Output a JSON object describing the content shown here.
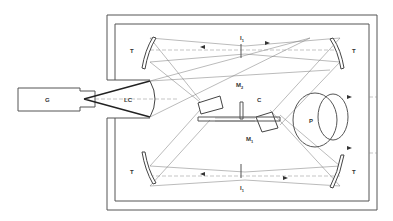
{
  "diagram": {
    "labels": {
      "G": "G",
      "LC": "LC",
      "T_top_left": "T",
      "T_top_right": "T",
      "T_bottom_left": "T",
      "T_bottom_right": "T",
      "I1_top": "I",
      "I1_top_sub": "1",
      "I1_bottom": "I",
      "I1_bottom_sub": "1",
      "M2": "M",
      "M2_sub": "2",
      "M1": "M",
      "M1_sub": "1",
      "C": "C",
      "P": "P"
    },
    "colors": {
      "line": "#555555",
      "ray": "#777777",
      "background": "#ffffff"
    }
  }
}
